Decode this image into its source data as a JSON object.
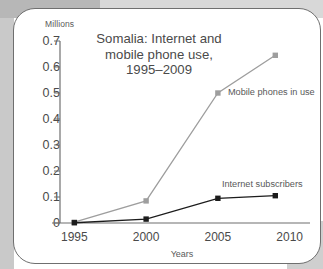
{
  "chart_data": {
    "type": "line",
    "title": "Somalia: Internet and\nmobile phone use,\n1995–2009",
    "xlabel": "Years",
    "ylabel": "Millions",
    "x": [
      1995,
      2000,
      2005,
      2009
    ],
    "xticks": [
      "1995",
      "2000",
      "2005",
      "2010"
    ],
    "xtick_values": [
      1995,
      2000,
      2005,
      2010
    ],
    "xlim": [
      1994,
      2011
    ],
    "yticks": [
      "0",
      "0.1",
      "0.2",
      "0.3",
      "0.4",
      "0.5",
      "0.6",
      "0.7"
    ],
    "ytick_values": [
      0,
      0.1,
      0.2,
      0.3,
      0.4,
      0.5,
      0.6,
      0.7
    ],
    "ylim": [
      0,
      0.7
    ],
    "grid": false,
    "legend_position": "inline-annotations",
    "series": [
      {
        "name": "Mobile phones in use",
        "color": "#9e9e9e",
        "marker": "square",
        "values": [
          0.003,
          0.085,
          0.5,
          0.645
        ]
      },
      {
        "name": "Internet subscribers",
        "color": "#1c1c1c",
        "marker": "square",
        "values": [
          0.001,
          0.015,
          0.095,
          0.105
        ]
      }
    ],
    "annotations": [
      {
        "text": "Mobile phones in use",
        "near_x": 2005,
        "near_y": 0.5
      },
      {
        "text": "Internet subscribers",
        "near_x": 2007,
        "near_y": 0.13
      }
    ]
  },
  "axis": {
    "unit_label": "Millions",
    "x_axis_title": "Years"
  },
  "colors": {
    "mobile_series": "#9e9e9e",
    "internet_series": "#1c1c1c",
    "axis": "#6f6f6f",
    "text": "#4a4a4a",
    "card_border": "#6f6f6f",
    "background": "#c9c9c9"
  }
}
